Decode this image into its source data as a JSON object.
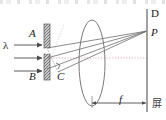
{
  "figure": {
    "background_color": "#ffffff"
  },
  "labels": {
    "wavelength": "λ",
    "slit_top": "A",
    "slit_bottom": "B",
    "angle_vertex": "C",
    "screen_top": "D",
    "bright_point": "P",
    "focal_length": "f",
    "screen_cn": "屏"
  },
  "colors": {
    "ink": "#4a4a4a",
    "ink_dark": "#1a1a1a",
    "barrier_fill": "#9a9a9a",
    "barrier_edge": "#5a5a5a",
    "lens_stroke": "#7a7a7a",
    "axis_dotted": "#e2a8bc",
    "screen_stroke": "#8a8a8a",
    "ray_stroke": "#6e6e6e",
    "dimension_stroke": "#5a5a5a"
  },
  "elements": {
    "incoming_rays_count": 3,
    "barrier_description": "vertical hatched opaque barrier with narrow central slit",
    "lens_description": "tall narrow biconvex converging lens ellipse",
    "screen_description": "vertical observation screen line at right",
    "right_angle_marker": "small square at C indicating perpendicular",
    "optical_axis": "horizontal dotted centre line",
    "dimension_label": "double-headed arrow marking focal length f from lens to screen"
  }
}
